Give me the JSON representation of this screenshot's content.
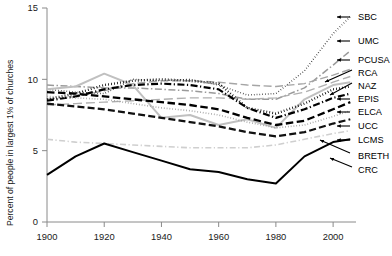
{
  "chart_data": {
    "type": "line",
    "title": "",
    "xlabel": "",
    "ylabel": "Percent of people in largest 1% of churches",
    "xlim": [
      1900,
      2008
    ],
    "ylim": [
      0,
      15
    ],
    "grid": false,
    "legend_position": "right-labels-with-arrows",
    "xticks": [
      1900,
      1920,
      1940,
      1960,
      1980,
      2000
    ],
    "xticklabels": [
      "1900",
      "1920",
      "1940",
      "1960",
      "1980",
      "2000"
    ],
    "yticks": [
      0,
      5,
      10,
      15
    ],
    "yticklabels": [
      "0",
      "5",
      "10",
      "15"
    ],
    "x": [
      1900,
      1910,
      1920,
      1930,
      1940,
      1950,
      1960,
      1970,
      1980,
      1990,
      2000,
      2006
    ],
    "series": [
      {
        "name": "SBC",
        "label": "SBC",
        "style": "fine-dotted",
        "color": "#111111",
        "width": 1.5,
        "dash": "0.6,2.2",
        "values": [
          9.3,
          9.1,
          9.0,
          10.0,
          9.9,
          10.0,
          9.6,
          8.9,
          9.0,
          10.6,
          13.2,
          14.4
        ]
      },
      {
        "name": "UMC",
        "label": "UMC",
        "style": "gray-dash-dot",
        "color": "#9a9a9a",
        "width": 1.5,
        "dash": "7,2.5,1.5,2.5",
        "values": [
          9.6,
          9.5,
          9.4,
          9.4,
          9.3,
          9.2,
          9.0,
          8.6,
          8.6,
          9.4,
          11.0,
          12.0
        ]
      },
      {
        "name": "PCUSA",
        "label": "PCUSA",
        "style": "gray-long-dash",
        "color": "#a5a5a5",
        "width": 1.4,
        "dash": "8,3.5",
        "values": [
          8.6,
          8.8,
          9.2,
          9.7,
          9.9,
          9.9,
          9.8,
          9.6,
          9.5,
          9.7,
          10.3,
          10.7
        ]
      },
      {
        "name": "RCA",
        "label": "RCA",
        "style": "gray-long-dash-2",
        "color": "#b0b0b0",
        "width": 1.4,
        "dash": "9,4",
        "values": [
          8.2,
          8.3,
          8.4,
          8.5,
          8.6,
          8.7,
          8.7,
          8.6,
          8.7,
          9.1,
          9.8,
          10.2
        ]
      },
      {
        "name": "NAZ",
        "label": "NAZ",
        "style": "gray-solid",
        "color": "#c0c0c0",
        "width": 2.0,
        "dash": "",
        "values": [
          9.3,
          9.5,
          10.4,
          9.6,
          7.3,
          7.5,
          6.8,
          7.2,
          6.6,
          8.6,
          9.6,
          9.8
        ]
      },
      {
        "name": "EPIS",
        "label": "EPIS",
        "style": "bold-dotted",
        "color": "#000000",
        "width": 2.4,
        "dash": "0.8,2.2",
        "values": [
          8.6,
          9.0,
          9.6,
          9.9,
          10.0,
          9.9,
          9.7,
          8.0,
          7.6,
          8.3,
          9.3,
          9.5
        ]
      },
      {
        "name": "ELCA",
        "label": "ELCA",
        "style": "bold-dash-dot",
        "color": "#000000",
        "width": 2.2,
        "dash": "7,2.5,1.2,2.5",
        "values": [
          8.5,
          8.8,
          9.3,
          9.6,
          9.7,
          9.6,
          9.3,
          8.0,
          7.3,
          7.9,
          8.7,
          9.0
        ]
      },
      {
        "name": "UCC",
        "label": "UCC",
        "style": "bold-dashed",
        "color": "#000000",
        "width": 2.3,
        "dash": "7.5,3.5",
        "values": [
          9.1,
          9.0,
          8.8,
          8.6,
          8.4,
          8.2,
          7.9,
          7.3,
          6.8,
          7.1,
          7.9,
          8.4
        ]
      },
      {
        "name": "LCMS",
        "label": "LCMS",
        "style": "gray-fine-dotted",
        "color": "#9e9e9e",
        "width": 1.6,
        "dash": "0.8,2.0",
        "values": [
          8.8,
          8.7,
          8.6,
          8.3,
          8.0,
          7.8,
          7.5,
          7.0,
          6.6,
          6.8,
          7.4,
          7.8
        ]
      },
      {
        "name": "BRETH",
        "label": "BRETH",
        "style": "bold-dashed-low",
        "color": "#111111",
        "width": 2.2,
        "dash": "7,3.2",
        "values": [
          8.3,
          8.1,
          7.9,
          7.6,
          7.3,
          7.0,
          6.7,
          6.3,
          6.0,
          6.3,
          6.9,
          7.2
        ]
      },
      {
        "name": "CRC-gray",
        "label": "",
        "style": "light-gray-dash-dot",
        "color": "#cfcfcf",
        "width": 1.6,
        "dash": "6,2.5,1.2,2.5",
        "values": [
          5.8,
          5.6,
          5.5,
          5.4,
          5.3,
          5.2,
          5.2,
          5.2,
          5.4,
          5.8,
          6.2,
          6.4
        ]
      },
      {
        "name": "CRC",
        "label": "CRC",
        "style": "solid-black",
        "color": "#000000",
        "width": 2.0,
        "dash": "",
        "values": [
          3.3,
          4.6,
          5.5,
          4.9,
          4.3,
          3.7,
          3.5,
          3.0,
          2.7,
          4.6,
          5.6,
          5.8
        ]
      }
    ],
    "legend_labels": [
      "SBC",
      "UMC",
      "PCUSA",
      "RCA",
      "NAZ",
      "EPIS",
      "ELCA",
      "UCC",
      "LCMS",
      "BRETH",
      "CRC"
    ]
  }
}
